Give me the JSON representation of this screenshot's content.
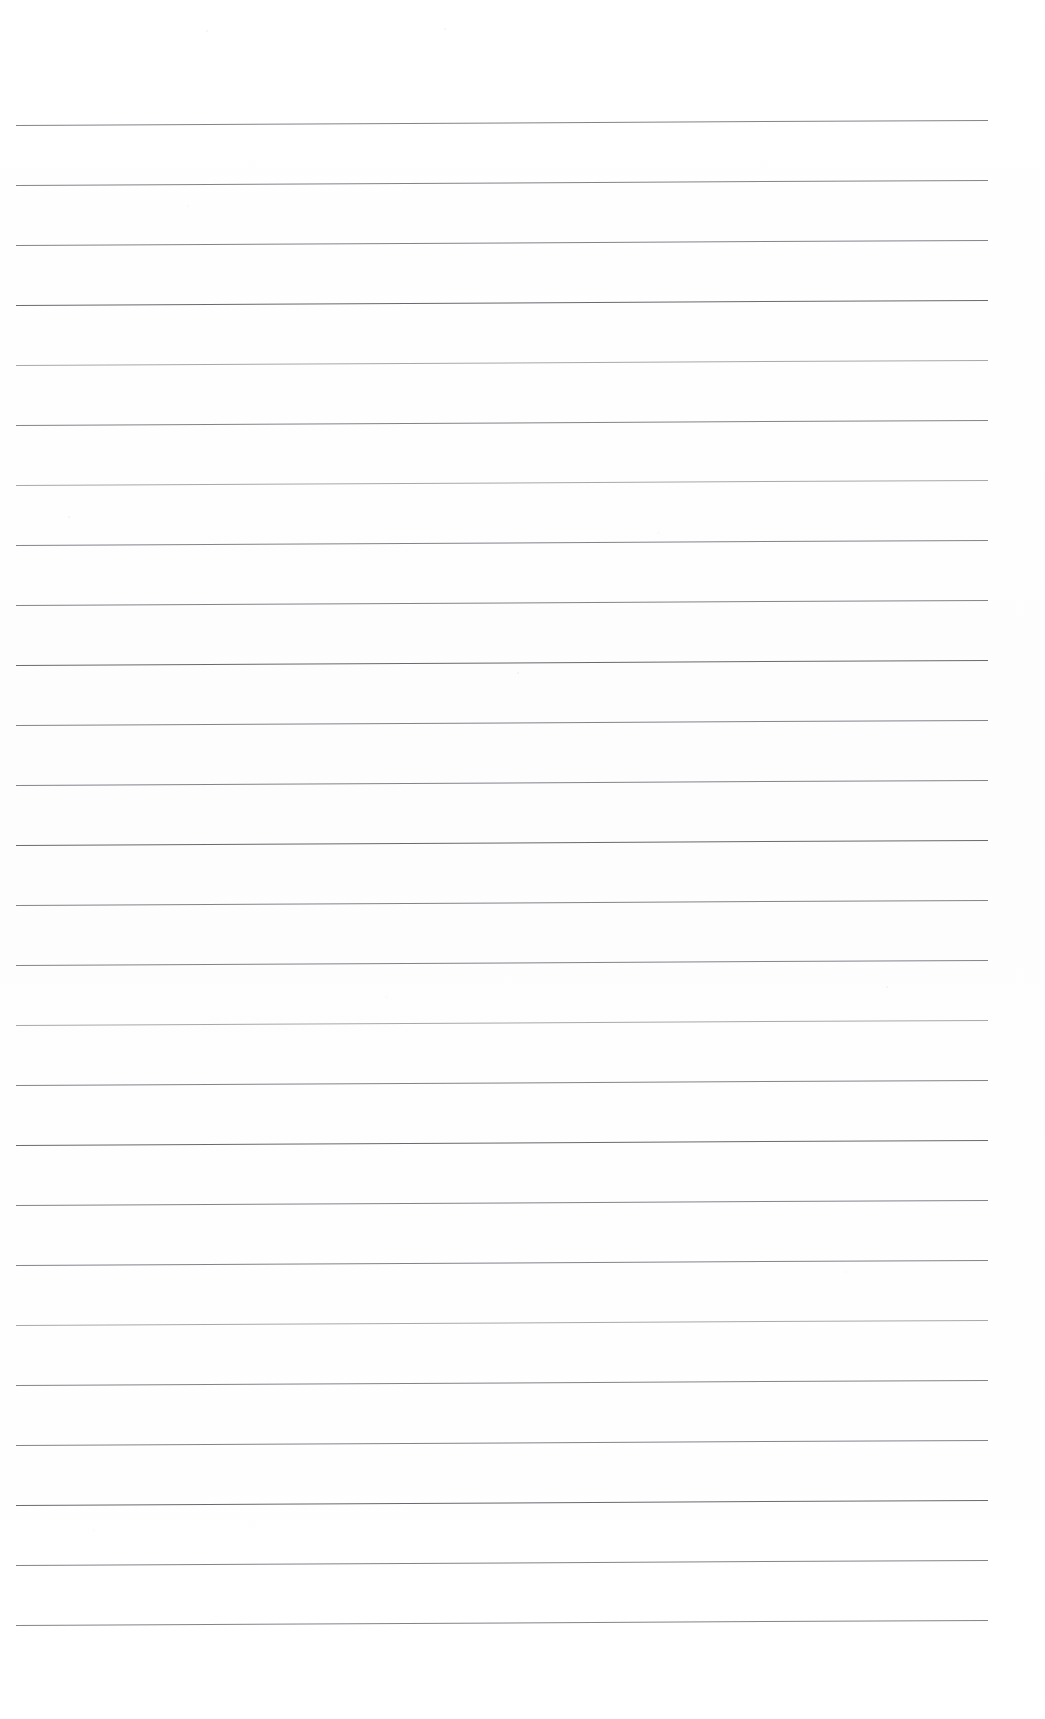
{
  "document": {
    "kind": "scanned-lined-paper",
    "title": "Blank ruled notebook page",
    "page_width": 1045,
    "page_height": 1719,
    "background_color": "#fefefe",
    "rule_color": "#6c6f74",
    "text_content": "",
    "visible_text": [],
    "margins": {
      "top": 125,
      "bottom": 86,
      "left": 16,
      "right": 57
    },
    "ruling": {
      "line_count": 26,
      "line_spacing_px": 60,
      "first_line_y": 125,
      "last_line_y": 1625,
      "line_start_x": 16,
      "line_end_x": 988,
      "line_length_px": 972,
      "line_thickness_px": 1,
      "skew_degrees": -0.3,
      "skew_note": "lines rise ~5px from left edge to right edge"
    },
    "lines": [
      {
        "index": 1,
        "y": 125,
        "weight": "normal"
      },
      {
        "index": 2,
        "y": 185,
        "weight": "normal"
      },
      {
        "index": 3,
        "y": 245,
        "weight": "normal"
      },
      {
        "index": 4,
        "y": 305,
        "weight": "dark"
      },
      {
        "index": 5,
        "y": 365,
        "weight": "light"
      },
      {
        "index": 6,
        "y": 425,
        "weight": "normal"
      },
      {
        "index": 7,
        "y": 485,
        "weight": "light"
      },
      {
        "index": 8,
        "y": 545,
        "weight": "normal"
      },
      {
        "index": 9,
        "y": 605,
        "weight": "normal"
      },
      {
        "index": 10,
        "y": 665,
        "weight": "dark"
      },
      {
        "index": 11,
        "y": 725,
        "weight": "normal"
      },
      {
        "index": 12,
        "y": 785,
        "weight": "normal"
      },
      {
        "index": 13,
        "y": 845,
        "weight": "dark"
      },
      {
        "index": 14,
        "y": 905,
        "weight": "normal"
      },
      {
        "index": 15,
        "y": 965,
        "weight": "normal"
      },
      {
        "index": 16,
        "y": 1025,
        "weight": "light"
      },
      {
        "index": 17,
        "y": 1085,
        "weight": "normal"
      },
      {
        "index": 18,
        "y": 1145,
        "weight": "dark"
      },
      {
        "index": 19,
        "y": 1205,
        "weight": "normal"
      },
      {
        "index": 20,
        "y": 1265,
        "weight": "normal"
      },
      {
        "index": 21,
        "y": 1325,
        "weight": "light"
      },
      {
        "index": 22,
        "y": 1385,
        "weight": "normal"
      },
      {
        "index": 23,
        "y": 1445,
        "weight": "normal"
      },
      {
        "index": 24,
        "y": 1505,
        "weight": "dark"
      },
      {
        "index": 25,
        "y": 1565,
        "weight": "normal"
      },
      {
        "index": 26,
        "y": 1625,
        "weight": "normal"
      }
    ],
    "specks": [
      {
        "x": 206,
        "y": 30,
        "size": 2
      },
      {
        "x": 444,
        "y": 28,
        "size": 2
      },
      {
        "x": 68,
        "y": 516,
        "size": 2
      },
      {
        "x": 517,
        "y": 672,
        "size": 2
      },
      {
        "x": 886,
        "y": 986,
        "size": 2
      }
    ]
  }
}
